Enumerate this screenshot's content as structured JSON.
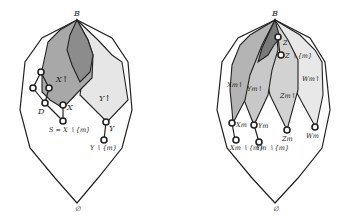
{
  "left_diagram": {
    "top_label": "B",
    "bottom_label": "∅",
    "region_labels": {
      "x_up": "X↑",
      "y_up": "Y↑"
    },
    "node_labels": {
      "d": "D",
      "x": "X",
      "s": "S = X ∖ {m}",
      "y": "Y",
      "y_minus": "Y ∖ {m}"
    },
    "colors": {
      "x_up_fill": "#a8a8a8",
      "overlap_fill": "#8c8c8c",
      "y_up_fill": "#e6e6e6"
    }
  },
  "right_diagram": {
    "top_label": "B",
    "bottom_label": "∅",
    "region_labels": {
      "xm_up": "Xm↑",
      "ym_up": "Ym↑",
      "zm_up": "Zm↑",
      "wm_up": "Wm↑"
    },
    "node_labels": {
      "z": "Z",
      "z_minus": "Z ∖ {m}",
      "xm": "Xm",
      "ym": "Ym",
      "zm": "Zm",
      "wm": "Wm",
      "xm_minus": "Xm ∖ {m}",
      "ym_minus": "Ym ∖ {m}"
    },
    "colors": {
      "xm_fill": "#b4b4b4",
      "ym_fill": "#c8c8c8",
      "zm_fill": "#d2d2d2",
      "wm_fill": "#e8e8e8",
      "dark_overlap": "#7a7a7a"
    }
  }
}
